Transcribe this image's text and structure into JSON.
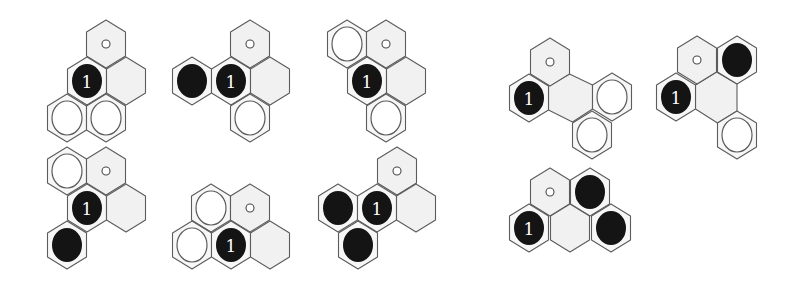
{
  "figure": {
    "colors": {
      "empty_fill": "#f1f1f1",
      "stone_cell_fill": "#f7f7f7",
      "grid_stroke": "#5c5c5c",
      "black_stone": "#141414",
      "white_stone": "#ffffff",
      "label_color": "#ffffff"
    },
    "hex_half_width": 19.5,
    "hex_radius": 24,
    "stone_rx": 15,
    "stone_ry": 17,
    "dot_r": 4,
    "diagrams": [
      {
        "id": "pattern-1",
        "cells": [
          {
            "x": 106,
            "y": 44,
            "content": "dot"
          },
          {
            "x": 87,
            "y": 81,
            "content": "black",
            "label": "1"
          },
          {
            "x": 126,
            "y": 81,
            "content": "empty"
          },
          {
            "x": 67,
            "y": 118,
            "content": "white"
          },
          {
            "x": 106,
            "y": 118,
            "content": "white"
          }
        ]
      },
      {
        "id": "pattern-2",
        "cells": [
          {
            "x": 250,
            "y": 44,
            "content": "dot"
          },
          {
            "x": 192,
            "y": 81,
            "content": "black"
          },
          {
            "x": 231,
            "y": 81,
            "content": "black",
            "label": "1"
          },
          {
            "x": 270,
            "y": 81,
            "content": "empty"
          },
          {
            "x": 250,
            "y": 118,
            "content": "white"
          }
        ]
      },
      {
        "id": "pattern-3",
        "cells": [
          {
            "x": 347,
            "y": 44,
            "content": "white"
          },
          {
            "x": 386,
            "y": 44,
            "content": "dot"
          },
          {
            "x": 367,
            "y": 81,
            "content": "black",
            "label": "1"
          },
          {
            "x": 406,
            "y": 81,
            "content": "empty"
          },
          {
            "x": 386,
            "y": 118,
            "content": "white"
          }
        ]
      },
      {
        "id": "pattern-4",
        "cells": [
          {
            "x": 67,
            "y": 171,
            "content": "white"
          },
          {
            "x": 106,
            "y": 171,
            "content": "dot"
          },
          {
            "x": 87,
            "y": 208,
            "content": "black",
            "label": "1"
          },
          {
            "x": 126,
            "y": 208,
            "content": "empty"
          },
          {
            "x": 67,
            "y": 245,
            "content": "black"
          }
        ]
      },
      {
        "id": "pattern-5",
        "cells": [
          {
            "x": 211,
            "y": 208,
            "content": "white"
          },
          {
            "x": 250,
            "y": 208,
            "content": "dot"
          },
          {
            "x": 192,
            "y": 245,
            "content": "white"
          },
          {
            "x": 231,
            "y": 245,
            "content": "black",
            "label": "1"
          },
          {
            "x": 270,
            "y": 245,
            "content": "empty"
          }
        ]
      },
      {
        "id": "pattern-6",
        "cells": [
          {
            "x": 397,
            "y": 171,
            "content": "dot"
          },
          {
            "x": 338,
            "y": 208,
            "content": "black"
          },
          {
            "x": 377,
            "y": 208,
            "content": "black",
            "label": "1"
          },
          {
            "x": 416,
            "y": 208,
            "content": "empty"
          },
          {
            "x": 358,
            "y": 245,
            "content": "black"
          }
        ]
      },
      {
        "id": "pattern-7",
        "cells": [
          {
            "x": 550,
            "y": 62,
            "content": "dot"
          },
          {
            "x": 529,
            "y": 98,
            "content": "black",
            "label": "1"
          },
          {
            "x": 612,
            "y": 97,
            "content": "white"
          },
          {
            "x": 592,
            "y": 135,
            "content": "white"
          }
        ],
        "merged_empty": [
          [
            548.5,
            86
          ],
          [
            569.5,
            74
          ],
          [
            592.5,
            85
          ],
          [
            592.5,
            109
          ],
          [
            572.5,
            122
          ],
          [
            548.5,
            110
          ]
        ]
      },
      {
        "id": "pattern-8",
        "cells": [
          {
            "x": 697,
            "y": 60,
            "content": "dot"
          },
          {
            "x": 737,
            "y": 60,
            "content": "black"
          },
          {
            "x": 676,
            "y": 97,
            "content": "black",
            "label": "1"
          },
          {
            "x": 737,
            "y": 135,
            "content": "white"
          }
        ],
        "merged_empty": [
          [
            695.5,
            85
          ],
          [
            716.5,
            72
          ],
          [
            737,
            84
          ],
          [
            737,
            111
          ],
          [
            717.5,
            123
          ],
          [
            695.5,
            109
          ]
        ]
      },
      {
        "id": "pattern-9",
        "cells": [
          {
            "x": 550,
            "y": 192,
            "content": "dot"
          },
          {
            "x": 590,
            "y": 192,
            "content": "black"
          },
          {
            "x": 529,
            "y": 228,
            "content": "black",
            "label": "1"
          },
          {
            "x": 570,
            "y": 228,
            "content": "empty"
          },
          {
            "x": 611,
            "y": 228,
            "content": "black"
          }
        ]
      }
    ]
  }
}
